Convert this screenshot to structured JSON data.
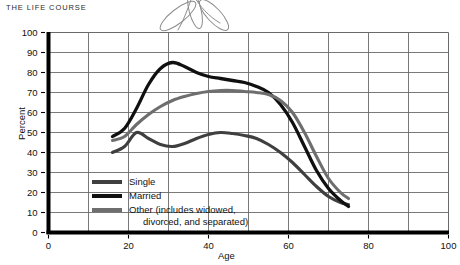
{
  "header": {
    "running_head": "THE LIFE COURSE"
  },
  "annotation": {
    "doodle_name": "hand-drawn-scribble",
    "doodle_color": "#8d8d8d"
  },
  "chart_data": {
    "type": "line",
    "title": "",
    "xlabel": "Age",
    "ylabel": "Percent",
    "xlim": [
      0,
      100
    ],
    "ylim": [
      0,
      100
    ],
    "xticks": [
      0,
      20,
      40,
      60,
      80,
      100
    ],
    "yticks": [
      0,
      10,
      20,
      30,
      40,
      50,
      60,
      70,
      80,
      90,
      100
    ],
    "grid": true,
    "legend_position": "inside-lower-left",
    "colors": {
      "single": "#3f3f3f",
      "married": "#101010",
      "other": "#6e6e6e",
      "axis": "#000000",
      "grid": "#6a6a6a"
    },
    "series": [
      {
        "name": "Single",
        "color": "#3f3f3f",
        "x": [
          16,
          19,
          22,
          25,
          28,
          31,
          34,
          37,
          40,
          43,
          46,
          49,
          52,
          55,
          58,
          61,
          64,
          67,
          70,
          73,
          75
        ],
        "y": [
          40,
          43,
          50,
          47,
          44,
          43,
          44.5,
          47,
          49,
          50,
          49.5,
          48.5,
          47,
          44,
          40,
          35,
          29,
          23,
          18,
          15,
          14
        ]
      },
      {
        "name": "Married",
        "color": "#101010",
        "x": [
          16,
          19,
          22,
          25,
          28,
          31,
          34,
          37,
          40,
          43,
          46,
          49,
          52,
          55,
          58,
          61,
          64,
          67,
          70,
          73,
          75
        ],
        "y": [
          48,
          52,
          62,
          74,
          82,
          85,
          83,
          80,
          78,
          77,
          76,
          75,
          73,
          70,
          64,
          55,
          43,
          31,
          22,
          16,
          13
        ]
      },
      {
        "name": "Other (includes widowed, divorced, and separated)",
        "color": "#6e6e6e",
        "x": [
          16,
          19,
          22,
          25,
          28,
          31,
          34,
          37,
          40,
          43,
          46,
          49,
          52,
          55,
          58,
          61,
          64,
          67,
          70,
          73,
          75
        ],
        "y": [
          46,
          48,
          54,
          59,
          63,
          66,
          68,
          69.5,
          70.5,
          71,
          71,
          70.5,
          70,
          69,
          66,
          60,
          50,
          38,
          27,
          20,
          17
        ]
      }
    ],
    "legend_entries": [
      {
        "label": "Single",
        "continuation": "",
        "color": "#3f3f3f"
      },
      {
        "label": "Married",
        "continuation": "",
        "color": "#101010"
      },
      {
        "label": "Other (includes widowed,",
        "continuation": "divorced, and separated)",
        "color": "#6e6e6e"
      }
    ]
  }
}
